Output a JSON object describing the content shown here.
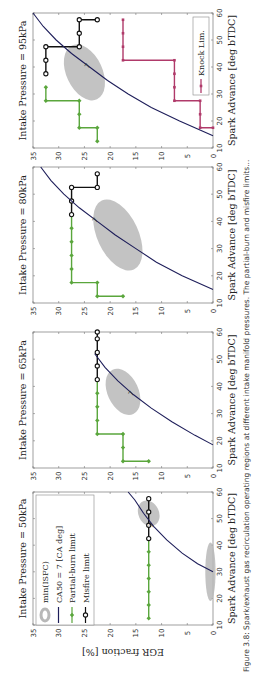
{
  "figure": {
    "orientation": "rotated 90 degrees counter-clockwise",
    "caption": "Figure 3.8: Spark/exhaust gas recirculation operating regions at different intake manifold pressures. The partial-burn and misfire limits..."
  },
  "colors": {
    "partial_burn": "#5aa63c",
    "misfire": "#111111",
    "knock": "#b03a6a",
    "ca50_curve": "#1e1e5a",
    "isfc_region": "#b8b8b8"
  },
  "legend": {
    "items": [
      {
        "label": "min(ISFC)",
        "style": "grey-ellipse"
      },
      {
        "label": "CA50 = 7 [CA deg]",
        "style": "navy-line"
      },
      {
        "label": "Partial-burn limit",
        "style": "green-diamond-line"
      },
      {
        "label": "Misfire limit",
        "style": "black-circle-line"
      }
    ],
    "knock_label": "Knock Lim."
  },
  "axes": {
    "xlabel": "Spark Advance [deg bTDC]",
    "ylabel": "EGR fraction [%]",
    "xticks": [
      "10",
      "20",
      "30",
      "40",
      "50",
      "60"
    ],
    "yticks": [
      "0",
      "5",
      "10",
      "15",
      "20",
      "25",
      "30",
      "35"
    ]
  },
  "chart_data": [
    {
      "type": "line",
      "title": "Intake Pressure = 50kPa",
      "xlabel": "Spark Advance [deg bTDC]",
      "ylabel": "EGR fraction [%]",
      "xlim": [
        10,
        60
      ],
      "ylim": [
        0,
        35
      ],
      "series": [
        {
          "name": "Partial-burn limit",
          "x": [
            12.5,
            17.5,
            22.5,
            27.5,
            32.5,
            37.5,
            42.5
          ],
          "y": [
            12.5,
            12.5,
            12.5,
            12.5,
            12.5,
            12.5,
            12.5
          ]
        },
        {
          "name": "Misfire limit",
          "x": [
            42.5,
            47.5,
            52.5,
            57.5
          ],
          "y": [
            12.5,
            12.5,
            12.5,
            12.5
          ]
        },
        {
          "name": "CA50 = 7 [CA deg]",
          "x": [
            30,
            33,
            37,
            42,
            47,
            52,
            57,
            60
          ],
          "y": [
            0,
            3,
            6,
            9,
            11.5,
            13.5,
            15.2,
            16.5
          ]
        }
      ],
      "isfc_regions": [
        {
          "center": [
            52,
            12.5
          ],
          "span_sa": 10,
          "span_egr": 4
        },
        {
          "center": [
            30,
            0.5
          ],
          "span_sa": 22,
          "span_egr": 2
        }
      ]
    },
    {
      "type": "line",
      "title": "Intake Pressure = 65kPa",
      "xlabel": "Spark Advance [deg bTDC]",
      "ylabel": "EGR fraction [%]",
      "xlim": [
        10,
        60
      ],
      "ylim": [
        0,
        35
      ],
      "series": [
        {
          "name": "Partial-burn limit",
          "x": [
            12.5,
            12.5,
            17.5,
            22.5,
            22.5,
            27.5,
            32.5,
            37.5,
            42.5
          ],
          "y": [
            12.5,
            17.5,
            17.5,
            17.5,
            22.5,
            22.5,
            22.5,
            22.5,
            22.5
          ]
        },
        {
          "name": "Misfire limit",
          "x": [
            42.5,
            47.5,
            52.5,
            57.5,
            60
          ],
          "y": [
            22.5,
            22.5,
            22.5,
            22.5,
            22.5
          ]
        },
        {
          "name": "CA50 = 7 [CA deg]",
          "x": [
            18.5,
            22,
            27,
            32,
            37,
            42,
            47,
            52
          ],
          "y": [
            0,
            3.5,
            8,
            12,
            15.5,
            18.5,
            21,
            23
          ]
        }
      ],
      "isfc_regions": [
        {
          "center": [
            38,
            17.5
          ],
          "span_sa": 18,
          "span_egr": 6
        }
      ]
    },
    {
      "type": "line",
      "title": "Intake Pressure = 80kPa",
      "xlabel": "Spark Advance [deg bTDC]",
      "ylabel": "EGR fraction [%]",
      "xlim": [
        10,
        60
      ],
      "ylim": [
        0,
        35
      ],
      "series": [
        {
          "name": "Partial-burn limit",
          "x": [
            12.5,
            12.5,
            17.5,
            17.5,
            22.5,
            27.5,
            32.5,
            37.5,
            42.5
          ],
          "y": [
            17.5,
            22.5,
            22.5,
            27.5,
            27.5,
            27.5,
            27.5,
            27.5,
            27.5
          ]
        },
        {
          "name": "Misfire limit",
          "x": [
            42.5,
            47.5,
            52.5,
            52.5,
            57.5
          ],
          "y": [
            27.5,
            27.5,
            27.5,
            22.5,
            22.5
          ]
        },
        {
          "name": "CA50 = 7 [CA deg]",
          "x": [
            15,
            20,
            25,
            30,
            35,
            40,
            45,
            50,
            55,
            60
          ],
          "y": [
            0,
            6,
            11,
            15,
            19,
            22.5,
            26,
            29,
            31.5,
            33.5
          ]
        }
      ],
      "isfc_regions": [
        {
          "center": [
            35,
            18.5
          ],
          "span_sa": 28,
          "span_egr": 8
        }
      ]
    },
    {
      "type": "line",
      "title": "Intake Pressure = 95kPa",
      "xlabel": "Spark Advance [deg bTDC]",
      "ylabel": "EGR fraction [%]",
      "xlim": [
        10,
        60
      ],
      "ylim": [
        0,
        35
      ],
      "series": [
        {
          "name": "Partial-burn limit",
          "x": [
            12.5,
            17.5,
            17.5,
            22.5,
            27.5,
            27.5,
            32.5
          ],
          "y": [
            22.5,
            22.5,
            26,
            26,
            26,
            32.5,
            32.5
          ]
        },
        {
          "name": "Misfire limit",
          "x": [
            37.5,
            42.5,
            47.5,
            47.5,
            52.5,
            57.5,
            57.5
          ],
          "y": [
            32.5,
            32.5,
            32.5,
            26,
            26,
            26,
            22.5
          ]
        },
        {
          "name": "Knock Lim.",
          "x": [
            17.5,
            17.5,
            22.5,
            27.5,
            27.5,
            32.5,
            37.5,
            42.5,
            42.5,
            47.5,
            52.5,
            57.5
          ],
          "y": [
            0,
            2.5,
            2.5,
            2.5,
            7.5,
            7.5,
            7.5,
            7.5,
            17.5,
            17.5,
            17.5,
            17.5
          ]
        },
        {
          "name": "CA50 = 7 [CA deg]",
          "x": [
            14.5,
            20,
            25,
            30,
            35,
            40,
            45,
            50,
            55,
            60
          ],
          "y": [
            0,
            6.5,
            12,
            16.5,
            20.5,
            24,
            27.5,
            30.5,
            33,
            35
          ]
        }
      ],
      "isfc_regions": [
        {
          "center": [
            38,
            25
          ],
          "span_sa": 22,
          "span_egr": 7
        }
      ]
    }
  ]
}
